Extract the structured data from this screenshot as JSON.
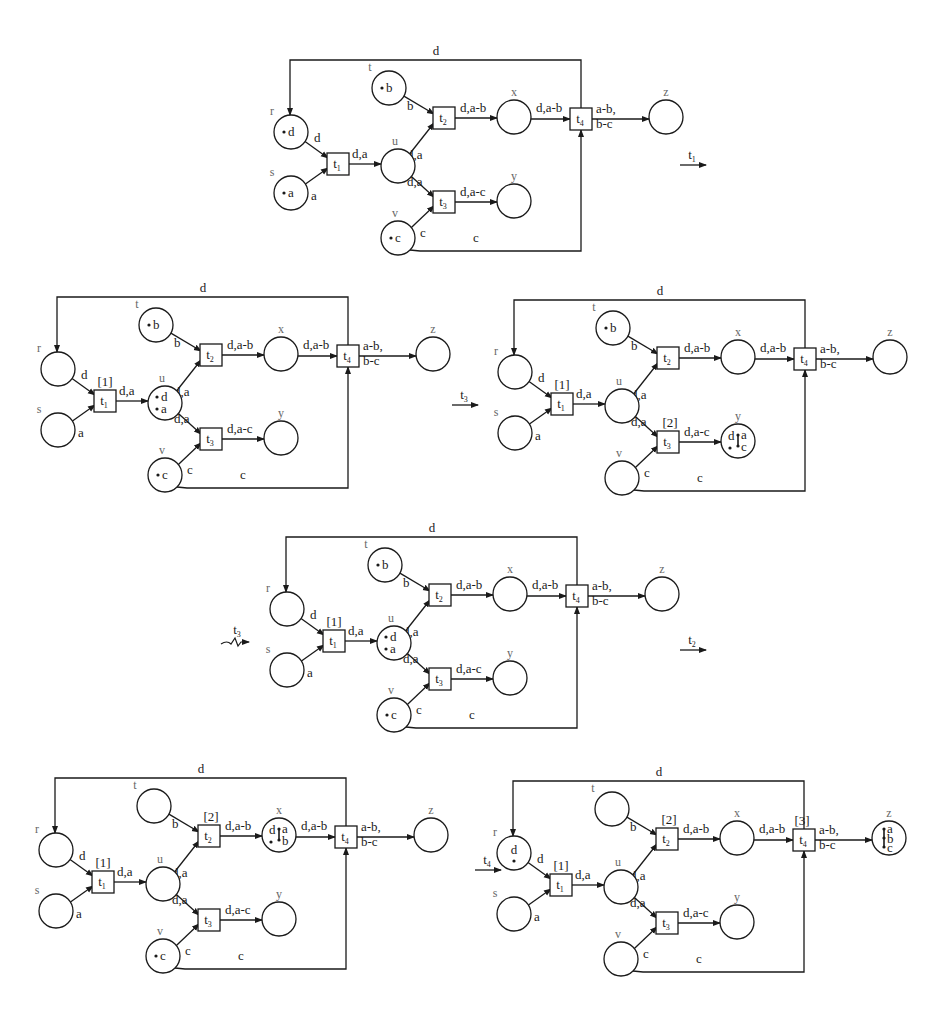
{
  "figure": {
    "places": [
      "r",
      "s",
      "t",
      "u",
      "v",
      "x",
      "y",
      "z"
    ],
    "transitions": [
      "t1",
      "t2",
      "t3",
      "t4"
    ],
    "arc_labels": {
      "r_t1": "d",
      "s_t1": "a",
      "t_t2": "b",
      "v_t3": "c",
      "t1_u": "d,a",
      "u_t2": "d,a",
      "u_t3": "d,a",
      "t2_x": "d,a-b",
      "t3_y": "d,a-c",
      "x_t4": "d,a-b",
      "t4_z_1": "a-b,",
      "t4_z_2": "b-c",
      "t4_r": "d",
      "v_t4": "c"
    },
    "diagrams": [
      {
        "id": "m0",
        "origin": [
          290,
          60
        ],
        "tokens": {
          "r": "• d",
          "s": "• a",
          "t": "• b",
          "v": "•c"
        },
        "firing_counters": {}
      },
      {
        "id": "m1",
        "origin": [
          57,
          297
        ],
        "tokens": {
          "t": "• b",
          "u": "•d •a",
          "v": "• c"
        },
        "firing_counters": {
          "t1": "[1]"
        }
      },
      {
        "id": "m2",
        "origin": [
          514,
          300
        ],
        "tokens": {
          "t": "• b",
          "y": "d-a-c"
        },
        "firing_counters": {
          "t1": "[1]",
          "t3": "[2]"
        }
      },
      {
        "id": "m3",
        "origin": [
          286,
          537
        ],
        "tokens": {
          "t": "• b",
          "u": "•d •a",
          "v": "• c"
        },
        "firing_counters": {
          "t1": "[1]"
        }
      },
      {
        "id": "m4",
        "origin": [
          55,
          778
        ],
        "tokens": {
          "x": "d-a-b",
          "v": "• c"
        },
        "firing_counters": {
          "t1": "[1]",
          "t2": "[2]"
        }
      },
      {
        "id": "m5",
        "origin": [
          513,
          781
        ],
        "tokens": {
          "r": "d",
          "z": "a-b-c"
        },
        "firing_counters": {
          "t1": "[1]",
          "t2": "[2]",
          "t4": "[3]"
        }
      }
    ],
    "step_arrows": [
      {
        "label": "t",
        "sub": "1",
        "x": 680,
        "y": 165,
        "style": "straight"
      },
      {
        "label": "t",
        "sub": "3",
        "x": 452,
        "y": 405,
        "style": "straight"
      },
      {
        "label": "t",
        "sub": "3",
        "x": 225,
        "y": 640,
        "style": "squiggle"
      },
      {
        "label": "t",
        "sub": "2",
        "x": 680,
        "y": 650,
        "style": "straight"
      },
      {
        "label": "t",
        "sub": "4",
        "x": 475,
        "y": 870,
        "style": "straight"
      }
    ]
  }
}
